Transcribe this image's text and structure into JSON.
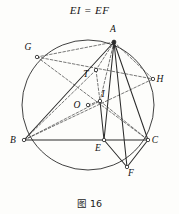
{
  "figure": {
    "title": "EI = EF",
    "caption": "图 16",
    "stroke_color": "#2b2b2b",
    "dashed_color": "#3d3d3d",
    "circle_color": "#2b2b2b",
    "background": "#fdfdfb"
  },
  "points": [
    {
      "id": "A",
      "label": "A",
      "x": 114,
      "y": 42,
      "lx": 113,
      "ly": 32,
      "marker": "filled"
    },
    {
      "id": "G",
      "label": "G",
      "x": 37,
      "y": 57,
      "lx": 28,
      "ly": 50,
      "marker": "open"
    },
    {
      "id": "H",
      "label": "H",
      "x": 153,
      "y": 79,
      "lx": 160,
      "ly": 82,
      "marker": "open"
    },
    {
      "id": "T",
      "label": "T",
      "x": 96,
      "y": 70,
      "lx": 86,
      "ly": 77,
      "marker": "open"
    },
    {
      "id": "I",
      "label": "I",
      "x": 100,
      "y": 101,
      "lx": 103,
      "ly": 97,
      "marker": "open"
    },
    {
      "id": "O",
      "label": "O",
      "x": 88,
      "y": 105,
      "lx": 77,
      "ly": 108,
      "marker": "open"
    },
    {
      "id": "B",
      "label": "B",
      "x": 24,
      "y": 140,
      "lx": 13,
      "ly": 143,
      "marker": "open"
    },
    {
      "id": "C",
      "label": "C",
      "x": 148,
      "y": 140,
      "lx": 155,
      "ly": 143,
      "marker": "open"
    },
    {
      "id": "E",
      "label": "E",
      "x": 104,
      "y": 140,
      "lx": 98,
      "ly": 151,
      "marker": "open"
    },
    {
      "id": "F",
      "label": "F",
      "x": 127,
      "y": 167,
      "lx": 131,
      "ly": 176,
      "marker": "open"
    }
  ],
  "circle": {
    "cx": 88,
    "cy": 105,
    "r": 66
  },
  "segments_solid": [
    {
      "name": "AB",
      "from": "A",
      "to": "B"
    },
    {
      "name": "AC",
      "from": "A",
      "to": "C"
    },
    {
      "name": "AE",
      "from": "A",
      "to": "E"
    },
    {
      "name": "AF",
      "from": "A",
      "to": "F"
    },
    {
      "name": "BC",
      "from": "B",
      "to": "C"
    },
    {
      "name": "EF",
      "from": "E",
      "to": "F"
    },
    {
      "name": "CF",
      "from": "C",
      "to": "F"
    },
    {
      "name": "IE",
      "from": "I",
      "to": "E"
    }
  ],
  "segments_dashed": [
    {
      "name": "AG",
      "from": "A",
      "to": "G"
    },
    {
      "name": "AH",
      "from": "A",
      "to": "H"
    },
    {
      "name": "AT",
      "from": "A",
      "to": "T"
    },
    {
      "name": "AI",
      "from": "A",
      "to": "I"
    },
    {
      "name": "GC",
      "from": "G",
      "to": "C"
    },
    {
      "name": "GH",
      "from": "G",
      "to": "H"
    },
    {
      "name": "BH",
      "from": "B",
      "to": "H"
    },
    {
      "name": "BI",
      "from": "B",
      "to": "I"
    },
    {
      "name": "TB",
      "from": "T",
      "to": "B"
    },
    {
      "name": "TI",
      "from": "T",
      "to": "I"
    },
    {
      "name": "OI",
      "from": "O",
      "to": "I"
    },
    {
      "name": "IC",
      "from": "I",
      "to": "C"
    }
  ]
}
